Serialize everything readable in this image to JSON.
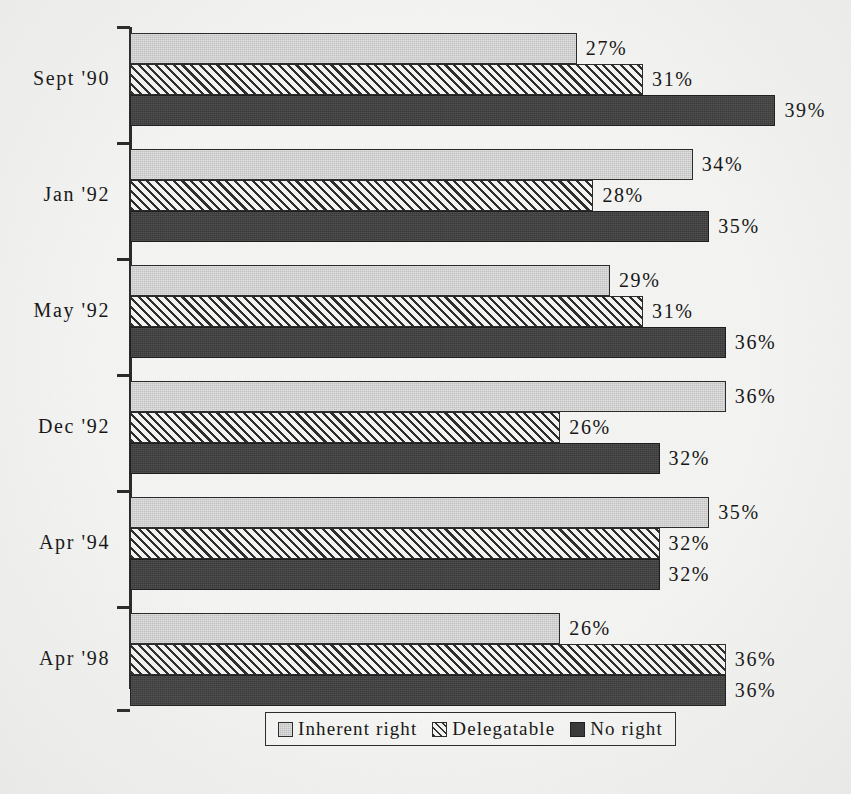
{
  "chart_data": {
    "type": "bar",
    "orientation": "horizontal",
    "title": "",
    "subtitle": "",
    "xlabel": "",
    "ylabel": "",
    "grid": false,
    "legend_position": "bottom",
    "axis_max_percent": 40,
    "value_suffix": "%",
    "categories": [
      "Sept '90",
      "Jan '92",
      "May '92",
      "Dec '92",
      "Apr '94",
      "Apr '98"
    ],
    "series": [
      {
        "name": "Inherent right",
        "pattern": "solid-light-gray",
        "color": "#c3c3c3",
        "values": [
          27,
          34,
          29,
          36,
          35,
          26
        ],
        "labels": [
          "27%",
          "34%",
          "29%",
          "36%",
          "35%",
          "26%"
        ]
      },
      {
        "name": "Delegatable",
        "pattern": "diagonal-hatch",
        "color": "#f2f2f0",
        "values": [
          31,
          28,
          31,
          26,
          32,
          36
        ],
        "labels": [
          "31%",
          "28%",
          "31%",
          "26%",
          "32%",
          "36%"
        ]
      },
      {
        "name": "No right",
        "pattern": "solid-dark",
        "color": "#393939",
        "values": [
          39,
          35,
          36,
          32,
          32,
          36
        ],
        "labels": [
          "39%",
          "35%",
          "36%",
          "32%",
          "32%",
          "36%"
        ]
      }
    ]
  },
  "legend": {
    "items": [
      {
        "label": "Inherent right"
      },
      {
        "label": "Delegatable"
      },
      {
        "label": "No right"
      }
    ]
  },
  "colors": {
    "background": "#f4f4f2",
    "ink": "#1c1c1c",
    "axis": "#2a2a2a",
    "series_inherent_right": "#c3c3c3",
    "series_delegatable": "#f2f2f0",
    "series_no_right": "#393939"
  }
}
